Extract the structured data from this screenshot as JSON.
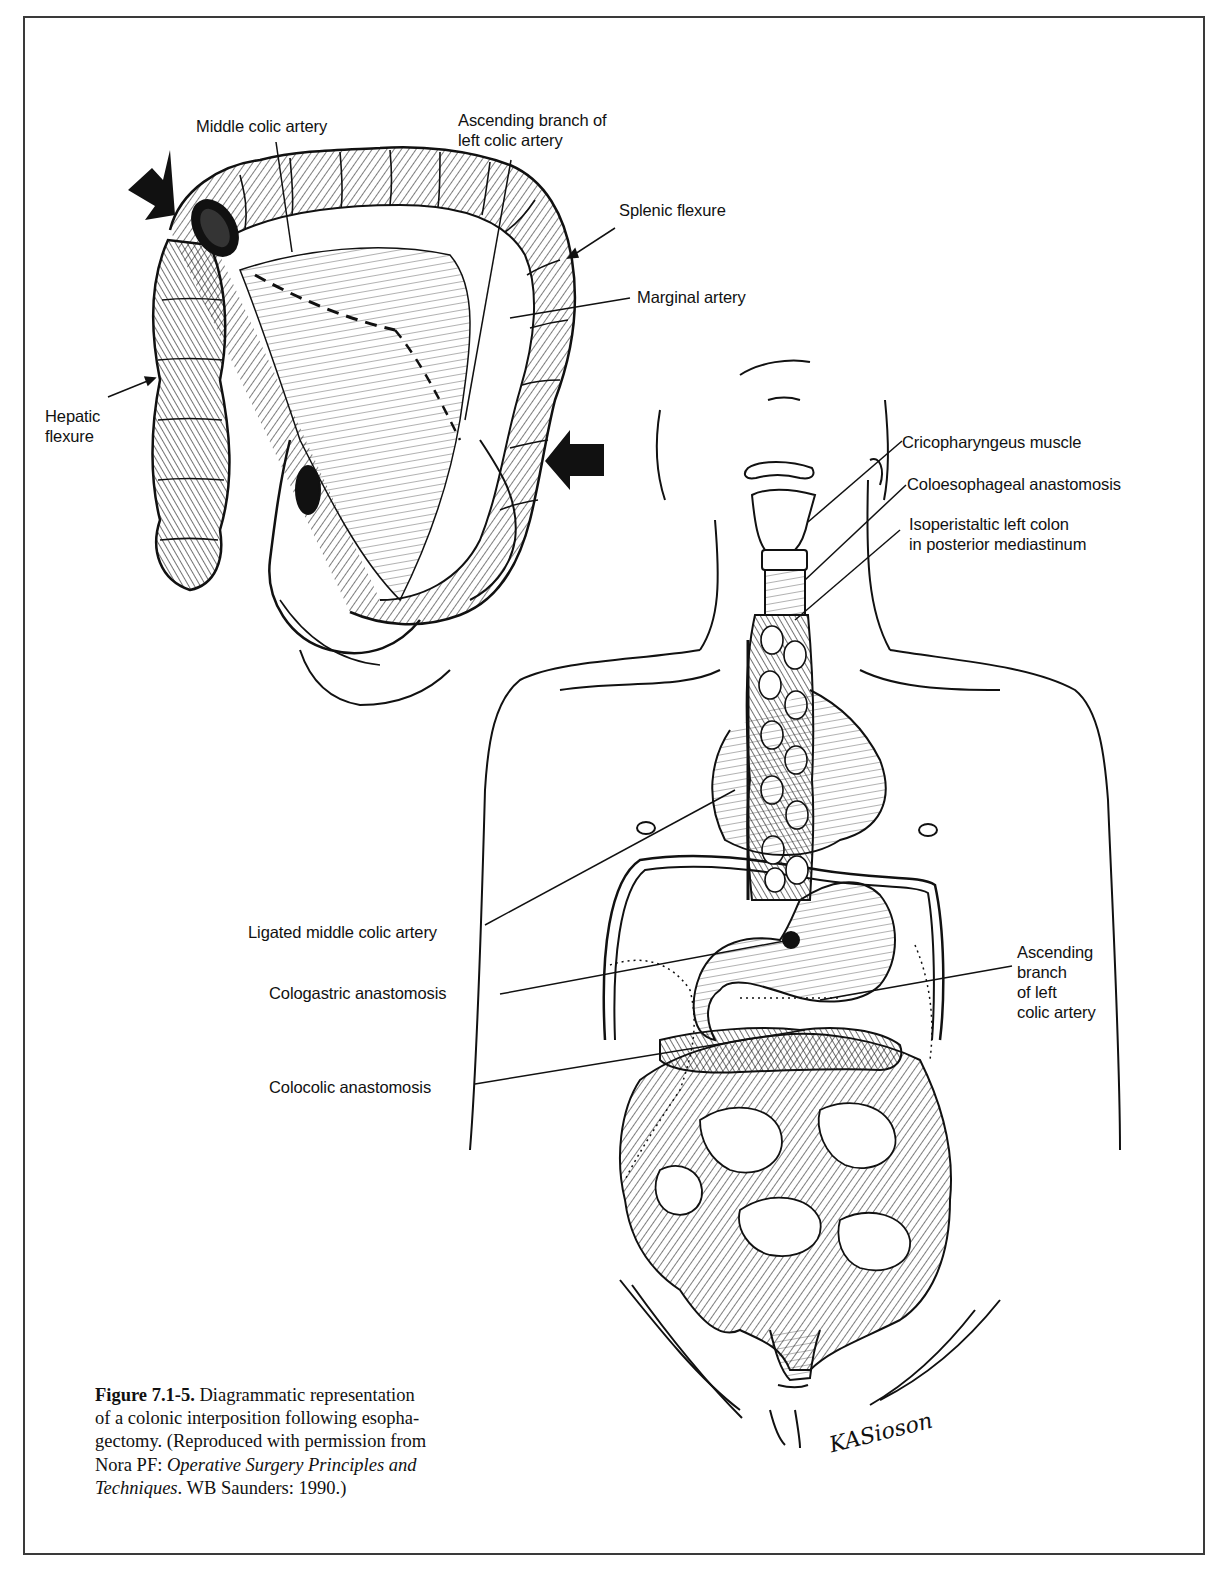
{
  "figure": {
    "number": "Figure 7.1-5.",
    "caption_text": "Diagrammatic representation of a colonic interposition following esophagectomy.",
    "caption_line1_rest": " Diagrammatic representation",
    "caption_line2": "of a colonic interposition following esopha-",
    "caption_line3": "gectomy. (Reproduced with permission from",
    "caption_line4_prefix": "Nora PF: ",
    "caption_line4_italic": "Operative Surgery Principles and",
    "caption_line5_italic": "Techniques",
    "caption_line5_rest": ". WB Saunders: 1990.)",
    "artist_signature": "KASioson"
  },
  "inset_colon_labels": {
    "middle_colic_artery": "Middle colic artery",
    "ascending_branch_left_colic": "Ascending branch of\nleft colic artery",
    "splenic_flexure": "Splenic flexure",
    "marginal_artery": "Marginal artery",
    "hepatic_flexure": "Hepatic\nflexure"
  },
  "torso_labels": {
    "cricopharyngeus_muscle": "Cricopharyngeus muscle",
    "coloesophageal_anastomosis": "Coloesophageal anastomosis",
    "isoperistaltic_left_colon": "Isoperistaltic left colon\nin posterior mediastinum",
    "ligated_middle_colic_artery": "Ligated middle colic artery",
    "cologastric_anastomosis": "Cologastric anastomosis",
    "ascending_branch_left_colic": "Ascending\nbranch\nof left\ncolic artery",
    "colocolic_anastomosis": "Colocolic anastomosis"
  },
  "colors": {
    "ink": "#111111",
    "frame": "#3a3a3a",
    "paper": "#ffffff"
  }
}
